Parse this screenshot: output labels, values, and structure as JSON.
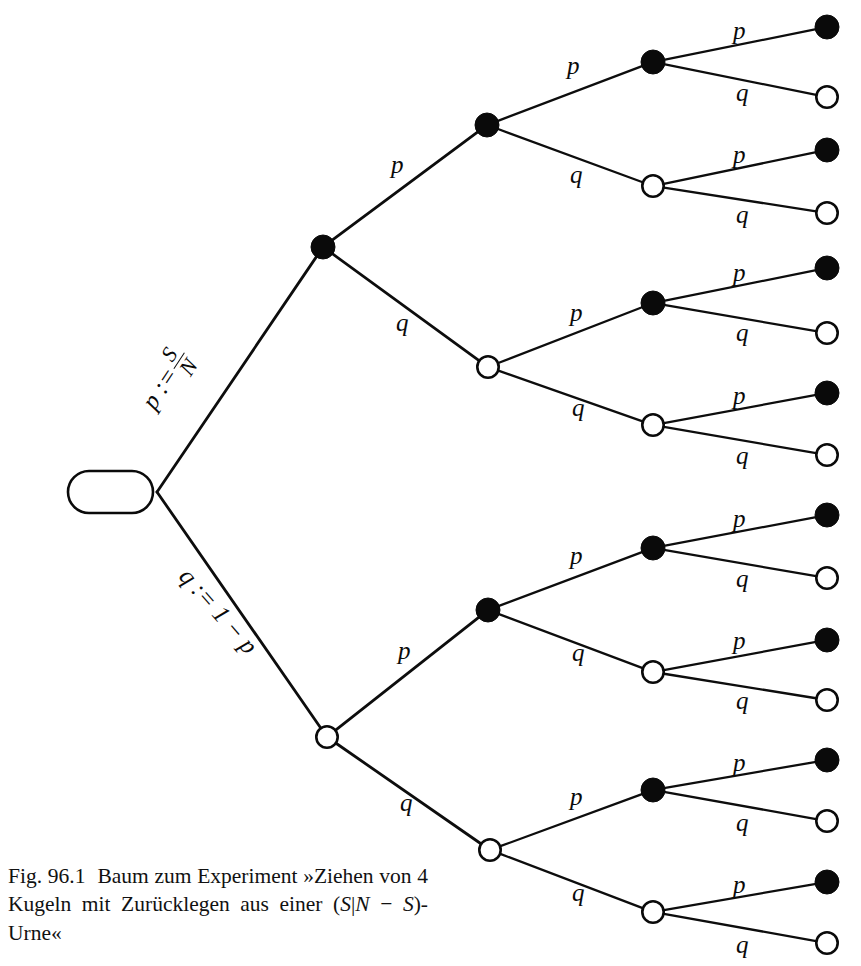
{
  "figure": {
    "start_node_label": "Start",
    "caption": {
      "number": "Fig. 96.1",
      "text_before": "Baum zum Experiment »Ziehen von 4 Kugeln mit Zurücklegen aus einer (",
      "math_s1": "S",
      "bar": "|",
      "math_n": "N",
      "minus": " − ",
      "math_s2": "S",
      "text_after": ")-Urne«",
      "full": "Fig. 96.1   Baum zum Experiment »Ziehen von 4 Kugeln mit Zurücklegen aus einer (S|N − S)-Urne«"
    },
    "colors": {
      "ink": "#0a0a0a",
      "paper": "#ffffff",
      "filled_node": "#0a0a0a",
      "open_node": "#ffffff"
    },
    "root_edge_labels": {
      "upper": {
        "lead": "p :=",
        "numerator": "S",
        "denominator": "N",
        "full": "p := S/N"
      },
      "lower": {
        "full": "q := 1 − p"
      }
    },
    "branch_label_p": "p",
    "branch_label_q": "q"
  },
  "chart_data": {
    "type": "diagram",
    "title": "Baum zum Experiment »Ziehen von 4 Kugeln mit Zurücklegen aus einer (S|N − S)-Urne«",
    "depth": 4,
    "branch_probabilities": [
      "p",
      "q"
    ],
    "definitions": [
      "p := S/N",
      "q := 1 − p"
    ],
    "node_kinds": {
      "filled": "black disc (success, probability p)",
      "open": "white circle (failure, probability q)"
    },
    "leaf_count": 16,
    "nodes": [
      {
        "id": "start",
        "level": 0,
        "x": 110,
        "y": 492,
        "kind": "start",
        "label": "Start"
      },
      {
        "id": "n1",
        "level": 1,
        "x": 323,
        "y": 247,
        "kind": "filled",
        "edge_label": "p := S/N"
      },
      {
        "id": "n2",
        "level": 1,
        "x": 327,
        "y": 737,
        "kind": "open",
        "edge_label": "q := 1 − p"
      },
      {
        "id": "n11",
        "level": 2,
        "x": 487,
        "y": 125,
        "kind": "filled",
        "edge_label": "p"
      },
      {
        "id": "n12",
        "level": 2,
        "x": 488,
        "y": 367,
        "kind": "open",
        "edge_label": "q"
      },
      {
        "id": "n21",
        "level": 2,
        "x": 488,
        "y": 610,
        "kind": "filled",
        "edge_label": "p"
      },
      {
        "id": "n22",
        "level": 2,
        "x": 490,
        "y": 850,
        "kind": "open",
        "edge_label": "q"
      },
      {
        "id": "n111",
        "level": 3,
        "x": 653,
        "y": 62,
        "kind": "filled",
        "edge_label": "p"
      },
      {
        "id": "n112",
        "level": 3,
        "x": 653,
        "y": 186,
        "kind": "open",
        "edge_label": "q"
      },
      {
        "id": "n121",
        "level": 3,
        "x": 653,
        "y": 303,
        "kind": "filled",
        "edge_label": "p"
      },
      {
        "id": "n122",
        "level": 3,
        "x": 653,
        "y": 425,
        "kind": "open",
        "edge_label": "q"
      },
      {
        "id": "n211",
        "level": 3,
        "x": 653,
        "y": 548,
        "kind": "filled",
        "edge_label": "p"
      },
      {
        "id": "n212",
        "level": 3,
        "x": 653,
        "y": 672,
        "kind": "open",
        "edge_label": "q"
      },
      {
        "id": "n221",
        "level": 3,
        "x": 653,
        "y": 790,
        "kind": "filled",
        "edge_label": "p"
      },
      {
        "id": "n222",
        "level": 3,
        "x": 653,
        "y": 912,
        "kind": "open",
        "edge_label": "q"
      },
      {
        "id": "l1",
        "level": 4,
        "x": 827,
        "y": 27,
        "kind": "filled",
        "edge_label": "p"
      },
      {
        "id": "l2",
        "level": 4,
        "x": 827,
        "y": 97,
        "kind": "open",
        "edge_label": "q"
      },
      {
        "id": "l3",
        "level": 4,
        "x": 827,
        "y": 150,
        "kind": "filled",
        "edge_label": "p"
      },
      {
        "id": "l4",
        "level": 4,
        "x": 827,
        "y": 213,
        "kind": "open",
        "edge_label": "q"
      },
      {
        "id": "l5",
        "level": 4,
        "x": 827,
        "y": 268,
        "kind": "filled",
        "edge_label": "p"
      },
      {
        "id": "l6",
        "level": 4,
        "x": 827,
        "y": 333,
        "kind": "open",
        "edge_label": "q"
      },
      {
        "id": "l7",
        "level": 4,
        "x": 827,
        "y": 393,
        "kind": "filled",
        "edge_label": "p"
      },
      {
        "id": "l8",
        "level": 4,
        "x": 827,
        "y": 455,
        "kind": "open",
        "edge_label": "q"
      },
      {
        "id": "l9",
        "level": 4,
        "x": 827,
        "y": 515,
        "kind": "filled",
        "edge_label": "p"
      },
      {
        "id": "l10",
        "level": 4,
        "x": 827,
        "y": 578,
        "kind": "open",
        "edge_label": "q"
      },
      {
        "id": "l11",
        "level": 4,
        "x": 827,
        "y": 640,
        "kind": "filled",
        "edge_label": "p"
      },
      {
        "id": "l12",
        "level": 4,
        "x": 827,
        "y": 700,
        "kind": "open",
        "edge_label": "q"
      },
      {
        "id": "l13",
        "level": 4,
        "x": 827,
        "y": 760,
        "kind": "filled",
        "edge_label": "p"
      },
      {
        "id": "l14",
        "level": 4,
        "x": 827,
        "y": 821,
        "kind": "open",
        "edge_label": "q"
      },
      {
        "id": "l15",
        "level": 4,
        "x": 827,
        "y": 882,
        "kind": "filled",
        "edge_label": "p"
      },
      {
        "id": "l16",
        "level": 4,
        "x": 827,
        "y": 943,
        "kind": "open",
        "edge_label": "q"
      }
    ],
    "edges": [
      {
        "from": "start",
        "to": "n1",
        "label": "p := S/N"
      },
      {
        "from": "start",
        "to": "n2",
        "label": "q := 1 − p"
      },
      {
        "from": "n1",
        "to": "n11",
        "label": "p"
      },
      {
        "from": "n1",
        "to": "n12",
        "label": "q"
      },
      {
        "from": "n2",
        "to": "n21",
        "label": "p"
      },
      {
        "from": "n2",
        "to": "n22",
        "label": "q"
      },
      {
        "from": "n11",
        "to": "n111",
        "label": "p"
      },
      {
        "from": "n11",
        "to": "n112",
        "label": "q"
      },
      {
        "from": "n12",
        "to": "n121",
        "label": "p"
      },
      {
        "from": "n12",
        "to": "n122",
        "label": "q"
      },
      {
        "from": "n21",
        "to": "n211",
        "label": "p"
      },
      {
        "from": "n21",
        "to": "n212",
        "label": "q"
      },
      {
        "from": "n22",
        "to": "n221",
        "label": "p"
      },
      {
        "from": "n22",
        "to": "n222",
        "label": "q"
      },
      {
        "from": "n111",
        "to": "l1",
        "label": "p"
      },
      {
        "from": "n111",
        "to": "l2",
        "label": "q"
      },
      {
        "from": "n112",
        "to": "l3",
        "label": "p"
      },
      {
        "from": "n112",
        "to": "l4",
        "label": "q"
      },
      {
        "from": "n121",
        "to": "l5",
        "label": "p"
      },
      {
        "from": "n121",
        "to": "l6",
        "label": "q"
      },
      {
        "from": "n122",
        "to": "l7",
        "label": "p"
      },
      {
        "from": "n122",
        "to": "l8",
        "label": "q"
      },
      {
        "from": "n211",
        "to": "l9",
        "label": "p"
      },
      {
        "from": "n211",
        "to": "l10",
        "label": "q"
      },
      {
        "from": "n212",
        "to": "l11",
        "label": "p"
      },
      {
        "from": "n212",
        "to": "l12",
        "label": "q"
      },
      {
        "from": "n221",
        "to": "l13",
        "label": "p"
      },
      {
        "from": "n221",
        "to": "l14",
        "label": "q"
      },
      {
        "from": "n222",
        "to": "l15",
        "label": "p"
      },
      {
        "from": "n222",
        "to": "l16",
        "label": "q"
      }
    ],
    "edge_label_positions": [
      {
        "edge": "n1-n11",
        "label": "p",
        "x": 391,
        "y": 152
      },
      {
        "edge": "n1-n12",
        "label": "q",
        "x": 396,
        "y": 310
      },
      {
        "edge": "n2-n21",
        "label": "p",
        "x": 398,
        "y": 638
      },
      {
        "edge": "n2-n22",
        "label": "q",
        "x": 400,
        "y": 790
      },
      {
        "edge": "n11-n111",
        "label": "p",
        "x": 567,
        "y": 53
      },
      {
        "edge": "n11-n112",
        "label": "q",
        "x": 570,
        "y": 162
      },
      {
        "edge": "n12-n121",
        "label": "p",
        "x": 570,
        "y": 300
      },
      {
        "edge": "n12-n122",
        "label": "q",
        "x": 572,
        "y": 395
      },
      {
        "edge": "n21-n211",
        "label": "p",
        "x": 570,
        "y": 543
      },
      {
        "edge": "n21-n212",
        "label": "q",
        "x": 572,
        "y": 640
      },
      {
        "edge": "n22-n221",
        "label": "p",
        "x": 570,
        "y": 784
      },
      {
        "edge": "n22-n222",
        "label": "q",
        "x": 572,
        "y": 880
      },
      {
        "edge": "n111-l1",
        "label": "p",
        "x": 733,
        "y": 18
      },
      {
        "edge": "n111-l2",
        "label": "q",
        "x": 736,
        "y": 80
      },
      {
        "edge": "n112-l3",
        "label": "p",
        "x": 733,
        "y": 142
      },
      {
        "edge": "n112-l4",
        "label": "q",
        "x": 736,
        "y": 202
      },
      {
        "edge": "n121-l5",
        "label": "p",
        "x": 733,
        "y": 260
      },
      {
        "edge": "n121-l6",
        "label": "q",
        "x": 736,
        "y": 320
      },
      {
        "edge": "n122-l7",
        "label": "p",
        "x": 733,
        "y": 383
      },
      {
        "edge": "n122-l8",
        "label": "q",
        "x": 736,
        "y": 443
      },
      {
        "edge": "n211-l9",
        "label": "p",
        "x": 733,
        "y": 506
      },
      {
        "edge": "n211-l10",
        "label": "q",
        "x": 736,
        "y": 566
      },
      {
        "edge": "n212-l11",
        "label": "p",
        "x": 733,
        "y": 628
      },
      {
        "edge": "n212-l12",
        "label": "q",
        "x": 736,
        "y": 688
      },
      {
        "edge": "n221-l13",
        "label": "p",
        "x": 733,
        "y": 750
      },
      {
        "edge": "n221-l14",
        "label": "q",
        "x": 736,
        "y": 810
      },
      {
        "edge": "n222-l15",
        "label": "p",
        "x": 733,
        "y": 872
      },
      {
        "edge": "n222-l16",
        "label": "q",
        "x": 736,
        "y": 932
      }
    ]
  }
}
